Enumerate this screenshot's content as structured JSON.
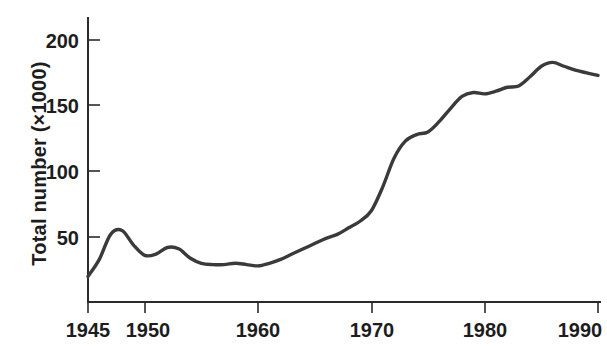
{
  "chart_data": {
    "type": "line",
    "title": "",
    "xlabel": "",
    "ylabel": "Total number (×1000)",
    "xlim": [
      1945,
      1990
    ],
    "ylim": [
      0,
      215
    ],
    "grid": false,
    "legend": null,
    "xticks": [
      1945,
      1950,
      1960,
      1970,
      1980,
      1990
    ],
    "xtick_labels": [
      "1945",
      "1950",
      "1960",
      "1970",
      "1980",
      "1990"
    ],
    "yticks": [
      50,
      100,
      150,
      200
    ],
    "ytick_labels": [
      "50",
      "100",
      "150",
      "200"
    ],
    "line_color": "#3a3a3a",
    "series": [
      {
        "name": "Total number",
        "x": [
          1945,
          1946,
          1947,
          1948,
          1949,
          1950,
          1951,
          1952,
          1953,
          1954,
          1955,
          1956,
          1957,
          1958,
          1959,
          1960,
          1961,
          1962,
          1963,
          1964,
          1965,
          1966,
          1967,
          1968,
          1969,
          1970,
          1971,
          1972,
          1973,
          1974,
          1975,
          1976,
          1977,
          1978,
          1979,
          1980,
          1981,
          1982,
          1983,
          1984,
          1985,
          1986,
          1987,
          1988,
          1989,
          1990
        ],
        "values": [
          20,
          33,
          52,
          55,
          44,
          36,
          37,
          42,
          41,
          34,
          30,
          29,
          29,
          30,
          29,
          28,
          30,
          33,
          37,
          41,
          45,
          49,
          52,
          57,
          62,
          70,
          88,
          110,
          123,
          128,
          130,
          138,
          148,
          157,
          160,
          159,
          161,
          164,
          165,
          172,
          180,
          183,
          180,
          177,
          175,
          173
        ]
      }
    ]
  },
  "axis": {
    "ylabel_text": "Total number (×1000)"
  }
}
